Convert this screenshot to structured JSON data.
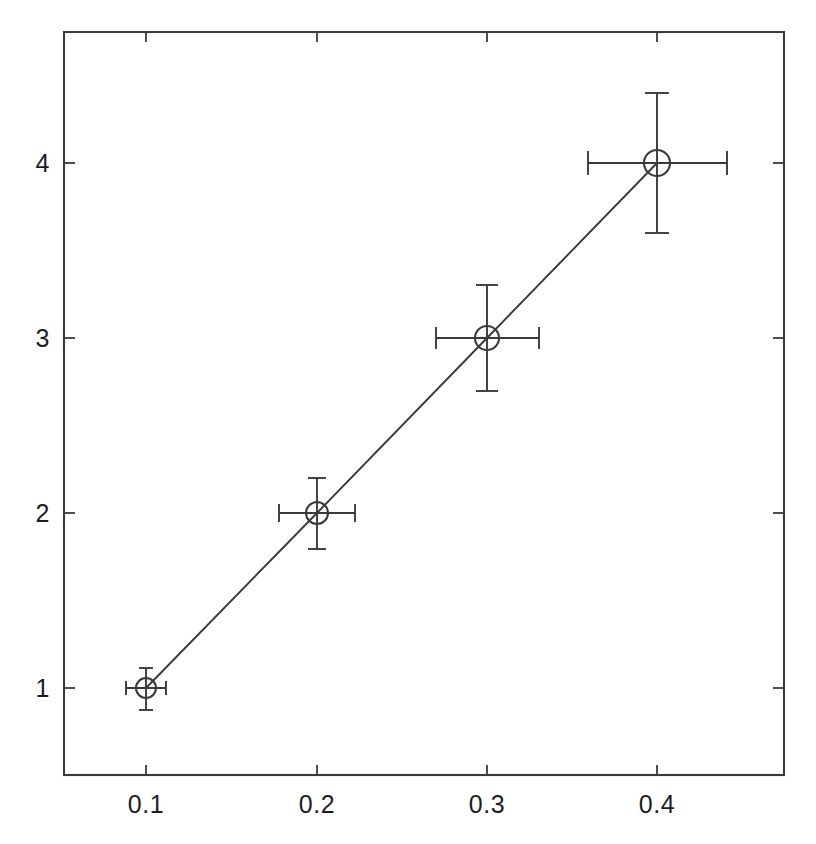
{
  "figure": {
    "width": 816,
    "height": 844,
    "background": "#ffffff",
    "ink_color": "#3a3a3a",
    "text_color": "#1d1d1f"
  },
  "axes": {
    "frame": {
      "left": 64,
      "right": 784,
      "top": 32,
      "bottom": 775
    },
    "tick_length": 9,
    "tick_side": "inside"
  },
  "chart_data": {
    "type": "scatter",
    "title": "",
    "subtitle": "",
    "xlabel": "",
    "ylabel": "",
    "xlim": [
      0.062,
      0.485
    ],
    "ylim": [
      0.5,
      4.78
    ],
    "grid": false,
    "legend": null,
    "legend_position": "none",
    "marker": "open-circle",
    "line_style": "solid",
    "error_bars": "both",
    "x": [
      0.1,
      0.2,
      0.3,
      0.4
    ],
    "y": [
      1,
      2,
      3,
      4
    ],
    "xerr": [
      0.011,
      0.022,
      0.03,
      0.04
    ],
    "yerr": [
      0.11,
      0.2,
      0.3,
      0.4
    ],
    "series": [
      {
        "name": "measurement",
        "points": [
          {
            "x": 0.1,
            "y": 1,
            "xerr": 0.011,
            "yerr": 0.11
          },
          {
            "x": 0.2,
            "y": 2,
            "xerr": 0.022,
            "yerr": 0.2
          },
          {
            "x": 0.3,
            "y": 3,
            "xerr": 0.03,
            "yerr": 0.3
          },
          {
            "x": 0.4,
            "y": 4,
            "xerr": 0.04,
            "yerr": 0.4
          }
        ]
      }
    ],
    "xticks": [
      0.1,
      0.2,
      0.3,
      0.4
    ],
    "xticklabels": [
      "0.1",
      "0.2",
      "0.3",
      "0.4"
    ],
    "yticks": [
      1,
      2,
      3,
      4
    ],
    "yticklabels": [
      "1",
      "2",
      "3",
      "4"
    ]
  },
  "xtick_labels": [
    {
      "text": "0.1",
      "px": 146,
      "py": 806
    },
    {
      "text": "0.2",
      "px": 317,
      "py": 806
    },
    {
      "text": "0.3",
      "px": 487,
      "py": 806
    },
    {
      "text": "0.4",
      "px": 657,
      "py": 806
    }
  ],
  "ytick_labels": [
    {
      "text": "4",
      "px": 44,
      "py": 163
    },
    {
      "text": "3",
      "px": 44,
      "py": 338
    },
    {
      "text": "2",
      "px": 44,
      "py": 513
    },
    {
      "text": "1",
      "px": 44,
      "py": 688
    }
  ],
  "markers": [
    {
      "name": "data-point-1",
      "cx": 146,
      "cy": 688,
      "r": 10,
      "yerr_top": 668,
      "yerr_bottom": 710,
      "xerr_left": 126,
      "xerr_right": 166,
      "cap": 7
    },
    {
      "name": "data-point-2",
      "cx": 317,
      "cy": 513,
      "r": 11,
      "yerr_top": 478,
      "yerr_bottom": 549,
      "xerr_left": 279,
      "xerr_right": 355,
      "cap": 9
    },
    {
      "name": "data-point-3",
      "cx": 487,
      "cy": 338,
      "r": 12,
      "yerr_top": 285,
      "yerr_bottom": 391,
      "xerr_left": 436,
      "xerr_right": 539,
      "cap": 11
    },
    {
      "name": "data-point-4",
      "cx": 657,
      "cy": 163,
      "r": 13,
      "yerr_top": 93,
      "yerr_bottom": 233,
      "xerr_left": 588,
      "xerr_right": 727,
      "cap": 12
    }
  ],
  "connector_path": "M 146,688 L 317,513 L 487,338 L 657,163"
}
